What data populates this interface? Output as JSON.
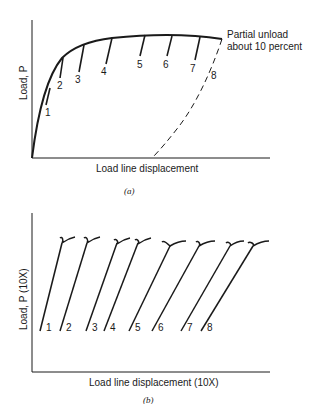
{
  "panel_a": {
    "caption": "(a)",
    "ylabel": "Load, P",
    "xlabel": "Load line displacement",
    "annotation_line1": "Partial unload",
    "annotation_line2": "about 10 percent",
    "unload_labels": [
      "1",
      "2",
      "3",
      "4",
      "5",
      "6",
      "7",
      "8"
    ]
  },
  "panel_b": {
    "caption": "(b)",
    "ylabel": "Load, P (10X)",
    "xlabel": "Load line displacement (10X)",
    "unload_labels": [
      "1",
      "2",
      "3",
      "4",
      "5",
      "6",
      "7",
      "8"
    ]
  },
  "colors": {
    "ink": "#1a1a1a",
    "background": "#ffffff"
  }
}
